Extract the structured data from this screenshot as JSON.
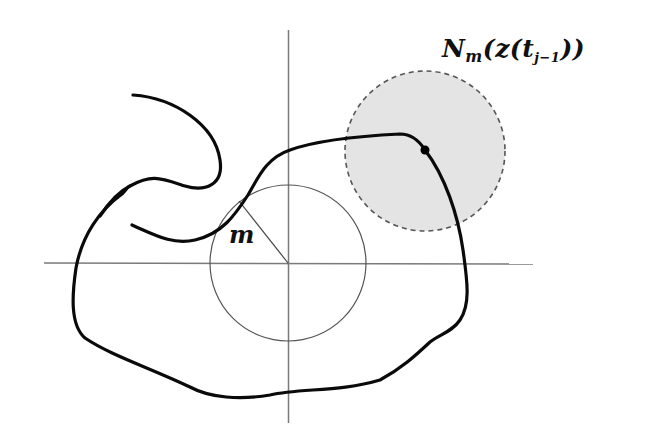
{
  "figure": {
    "labels": {
      "neighborhood": {
        "N": "N",
        "sub_m": "m",
        "open1": "(",
        "z": "z",
        "open2": "(",
        "t": "t",
        "sub_t": "j−1",
        "close": "))"
      },
      "radius": "m"
    },
    "colors": {
      "axis": "#777777",
      "curve": "#0a0a0a",
      "circle": "#555555",
      "shaded_fill": "#e4e4e4",
      "shaded_stroke": "#555555"
    },
    "elements": {
      "axes": {
        "origin": [
          288,
          263
        ],
        "x_range": [
          44,
          533
        ],
        "y_range": [
          30,
          423
        ]
      },
      "small_circle": {
        "center": [
          288,
          263
        ],
        "radius": 78
      },
      "neighborhood_circle": {
        "center": [
          425,
          151
        ],
        "radius": 80,
        "style": "dashed, shaded"
      },
      "marked_point": [
        425,
        150
      ]
    }
  }
}
